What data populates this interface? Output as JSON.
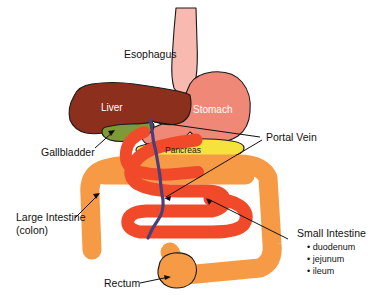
{
  "diagram": {
    "background_color": "#ffffff",
    "width": 381,
    "height": 306
  },
  "organ_labels": {
    "liver": "Liver",
    "stomach": "Stomach",
    "pancreas": "Pancreas"
  },
  "callouts": {
    "esophagus": "Esophagus",
    "gallbladder": "Gallbladder",
    "portal_vein": "Portal Vein",
    "large_intestine_line1": "Large Intestine",
    "large_intestine_line2": "(colon)",
    "small_intestine": "Small Intestine",
    "rectum": "Rectum"
  },
  "small_intestine_parts": [
    "• duodenum",
    "• jejunum",
    "• ileum"
  ],
  "colors": {
    "liver": "#8c2f1c",
    "stomach": "#f08878",
    "esophagus": "#f7b9b0",
    "gallbladder": "#7e9a38",
    "pancreas": "#f6e23c",
    "small_intestine": "#f04a2a",
    "large_intestine": "#f79a45",
    "portal_vein": "#4a3f7a",
    "outline": "#1a1a1a",
    "text": "#111111",
    "label_light": "#ffffff"
  }
}
